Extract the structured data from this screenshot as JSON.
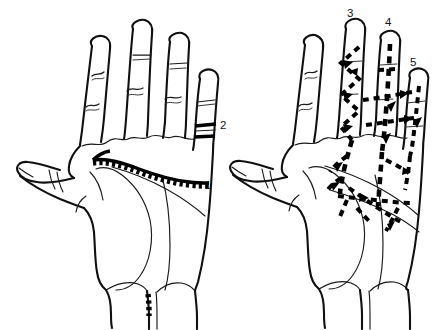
{
  "figure": {
    "background_color": "#ffffff",
    "ink_color": "#101010",
    "width": 433,
    "height": 330
  },
  "hands": [
    {
      "id": "left-hand",
      "name": "left-hand-diagram",
      "description": "Palmar view of a hand with a heavy toothed line crossing the palm and a short bold band on the little finger",
      "marking_style": "solid-bold-toothed",
      "labels": [
        "1",
        "2"
      ]
    },
    {
      "id": "right-hand",
      "name": "right-hand-diagram",
      "description": "Palmar view of a hand with heavy dashed lines and arrowheads over the fingers and palm",
      "marking_style": "dashed-with-arrowheads",
      "labels": [
        "3",
        "4",
        "5"
      ]
    }
  ],
  "labels": [
    {
      "id": "label-1",
      "text": "1",
      "hand": "left-hand",
      "x": 205,
      "y": 180,
      "target": "palm-transverse-line-end"
    },
    {
      "id": "label-2",
      "text": "2",
      "hand": "left-hand",
      "x": 220,
      "y": 120,
      "target": "little-finger-band"
    },
    {
      "id": "label-3",
      "text": "3",
      "hand": "right-hand",
      "x": 347,
      "y": 8,
      "target": "middle-finger-zigzag"
    },
    {
      "id": "label-4",
      "text": "4",
      "hand": "right-hand",
      "x": 385,
      "y": 17,
      "target": "ring-finger-dashed-line"
    },
    {
      "id": "label-5",
      "text": "5",
      "hand": "right-hand",
      "x": 410,
      "y": 57,
      "target": "little-finger-dashed-line"
    }
  ]
}
